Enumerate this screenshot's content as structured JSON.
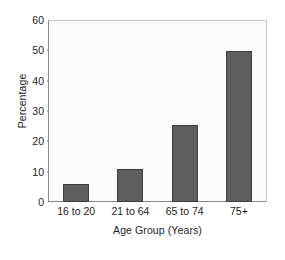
{
  "chart_data": {
    "type": "bar",
    "title": "",
    "categories": [
      "16 to 20",
      "21 to 64",
      "65 to 74",
      "75+"
    ],
    "values": [
      6,
      11,
      25.5,
      50
    ],
    "xlabel": "Age Group (Years)",
    "ylabel": "Percentage",
    "ylim": [
      0,
      60
    ],
    "ytick_step": 10,
    "yticks": [
      0,
      10,
      20,
      30,
      40,
      50,
      60
    ],
    "ytick_labels": [
      "0",
      "10",
      "20",
      "30",
      "40",
      "50",
      "60"
    ],
    "grid": false,
    "legend": false,
    "series": [
      {
        "name": "Percentage",
        "values": [
          6,
          11,
          25.5,
          50
        ]
      }
    ],
    "colors": {
      "bar_fill": "#5e5e5e",
      "bar_edge": "#3f3f3f",
      "plot_background": "#fbfbfb",
      "axis_line": "#8a8a8a",
      "frame_line": "#c9c9c9",
      "text": "#1d1d1d",
      "figure_background": "#ffffff"
    }
  }
}
